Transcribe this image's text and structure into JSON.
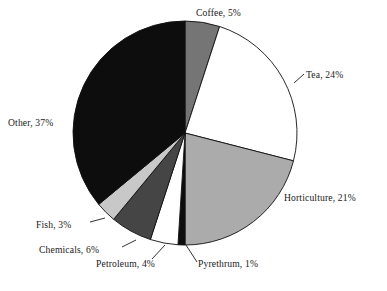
{
  "chart_data": {
    "type": "pie",
    "title": "",
    "subtitle": "",
    "xlabel": "",
    "ylabel": "",
    "legend_position": "none",
    "grid": false,
    "units": "percent",
    "start_angle_deg": 0,
    "direction": "clockwise",
    "categories": [
      "Coffee",
      "Tea",
      "Horticulture",
      "Pyrethrum",
      "Petroleum",
      "Chemicals",
      "Fish",
      "Other"
    ],
    "values": [
      5,
      24,
      21,
      1,
      4,
      6,
      3,
      37
    ],
    "total": 100,
    "slices": [
      {
        "name": "Coffee",
        "value": 5,
        "label": "Coffee, 5%",
        "fill": "#757575",
        "start_pct": 0,
        "end_pct": 5,
        "has_leader": false,
        "label_x": 196,
        "label_y": 14,
        "label_anchor": "start"
      },
      {
        "name": "Tea",
        "value": 24,
        "label": "Tea, 24%",
        "fill": "#ffffff",
        "start_pct": 5,
        "end_pct": 29,
        "has_leader": true,
        "leader": [
          294,
          83,
          304,
          74
        ],
        "label_x": 306,
        "label_y": 76,
        "label_anchor": "start"
      },
      {
        "name": "Horticulture",
        "value": 21,
        "label": "Horticulture, 21%",
        "fill": "#ababab",
        "start_pct": 29,
        "end_pct": 50,
        "has_leader": false,
        "label_x": 284,
        "label_y": 199,
        "label_anchor": "start"
      },
      {
        "name": "Pyrethrum",
        "value": 1,
        "label": "Pyrethrum, 1%",
        "fill": "#0d0d0d",
        "start_pct": 50,
        "end_pct": 51,
        "has_leader": true,
        "leader": [
          186,
          245,
          197,
          262
        ],
        "label_x": 198,
        "label_y": 265,
        "label_anchor": "start"
      },
      {
        "name": "Petroleum",
        "value": 4,
        "label": "Petroleum, 4%",
        "fill": "#ffffff",
        "start_pct": 51,
        "end_pct": 55,
        "has_leader": true,
        "leader": [
          165,
          245,
          152,
          259
        ],
        "label_x": 96,
        "label_y": 265,
        "label_anchor": "start"
      },
      {
        "name": "Chemicals",
        "value": 6,
        "label": "Chemicals, 6%",
        "fill": "#454545",
        "start_pct": 55,
        "end_pct": 61,
        "has_leader": true,
        "leader": [
          136,
          240,
          122,
          247
        ],
        "label_x": 39,
        "label_y": 251,
        "label_anchor": "start"
      },
      {
        "name": "Fish",
        "value": 3,
        "label": "Fish, 3%",
        "fill": "#c8c8c8",
        "start_pct": 61,
        "end_pct": 64,
        "has_leader": true,
        "leader": [
          105,
          218,
          90,
          222
        ],
        "label_x": 36,
        "label_y": 226,
        "label_anchor": "start"
      },
      {
        "name": "Other",
        "value": 37,
        "label": "Other, 37%",
        "fill": "#0d0d0d",
        "start_pct": 64,
        "end_pct": 100,
        "has_leader": false,
        "label_x": 8,
        "label_y": 124,
        "label_anchor": "start"
      }
    ],
    "geometry": {
      "center_x": 185,
      "center_y": 133,
      "radius": 112
    }
  }
}
